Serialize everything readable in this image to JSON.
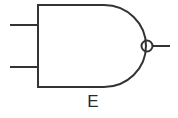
{
  "diagram": {
    "type": "logic-gate",
    "gate": "NAND",
    "inputs": 2,
    "outputs": 1,
    "label": "E",
    "stroke_color": "#333333"
  }
}
